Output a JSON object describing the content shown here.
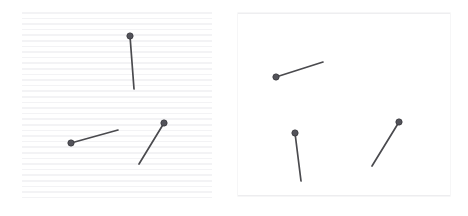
{
  "canvas": {
    "width": 468,
    "height": 216,
    "background": "#ffffff",
    "description": "Two side-by-side rectangular panels, each showing three pin-shaped marks (a straight line segment with a small round head)."
  },
  "colors": {
    "page_background": "#ffffff",
    "panel_background": "#ffffff",
    "stripe_line": "#f3f3f5",
    "panel_border": "#f0f0f2",
    "pin_stroke": "#4a4a4e",
    "pin_head_fill": "#53535a",
    "pin_head_stroke": "#3f3f44"
  },
  "panels": [
    {
      "id": "left",
      "name": "lined-panel",
      "label": "Left panel with horizontal ruled stripes",
      "x": 22,
      "y": 12,
      "width": 190,
      "height": 189,
      "has_stripes": true,
      "stripe_spacing_px": 5.6,
      "stripe_thickness_px": 1.6,
      "stripe_count": 34
    },
    {
      "id": "right",
      "name": "plain-panel",
      "label": "Right panel, plain white, no stripes",
      "x": 238,
      "y": 13,
      "width": 212,
      "height": 183,
      "has_stripes": false
    }
  ],
  "pins": [
    {
      "id": "left-pin-1",
      "panel": "left",
      "name": "pin-left-vertical",
      "head": {
        "x": 130,
        "y": 36,
        "r": 3.1
      },
      "tail": {
        "x": 134,
        "y": 89
      },
      "length": 53,
      "angle_deg": 85.7,
      "stroke_width": 1.7
    },
    {
      "id": "left-pin-2",
      "panel": "left",
      "name": "pin-left-lower-shallow",
      "head": {
        "x": 71,
        "y": 143,
        "r": 3.1
      },
      "tail": {
        "x": 118,
        "y": 130
      },
      "length": 48.8,
      "angle_deg": -15.5,
      "stroke_width": 1.7
    },
    {
      "id": "left-pin-3",
      "panel": "left",
      "name": "pin-left-diagonal",
      "head": {
        "x": 164,
        "y": 123,
        "r": 3.1
      },
      "tail": {
        "x": 139,
        "y": 164
      },
      "length": 48.0,
      "angle_deg": 58.6,
      "stroke_width": 1.7
    },
    {
      "id": "right-pin-1",
      "panel": "right",
      "name": "pin-right-shallow",
      "head": {
        "x": 276,
        "y": 77,
        "r": 3.1
      },
      "tail": {
        "x": 323,
        "y": 62
      },
      "length": 49.3,
      "angle_deg": -17.7,
      "stroke_width": 1.7
    },
    {
      "id": "right-pin-2",
      "panel": "right",
      "name": "pin-right-vertical",
      "head": {
        "x": 295,
        "y": 133,
        "r": 3.1
      },
      "tail": {
        "x": 301,
        "y": 181
      },
      "length": 48.4,
      "angle_deg": 82.9,
      "stroke_width": 1.7
    },
    {
      "id": "right-pin-3",
      "panel": "right",
      "name": "pin-right-diagonal",
      "head": {
        "x": 399,
        "y": 122,
        "r": 3.1
      },
      "tail": {
        "x": 372,
        "y": 166
      },
      "length": 51.6,
      "angle_deg": 58.5,
      "stroke_width": 1.7
    }
  ]
}
